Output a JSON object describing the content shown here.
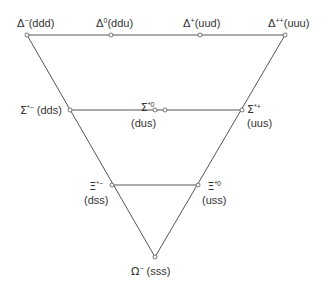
{
  "diagram": {
    "line_color": "#555555",
    "node_fill": "#ffffff",
    "rows": [
      {
        "name": "delta-row",
        "nodes": [
          {
            "symbol": "Δ",
            "charge": "−",
            "quarks": "(ddd)"
          },
          {
            "symbol": "Δ",
            "charge": "0",
            "quarks": "(ddu)"
          },
          {
            "symbol": "Δ",
            "charge": "+",
            "quarks": "(uud)"
          },
          {
            "symbol": "Δ",
            "charge": "++",
            "quarks": "(uuu)"
          }
        ]
      },
      {
        "name": "sigma-star-row",
        "nodes": [
          {
            "symbol": "Σ",
            "charge": "*−",
            "quarks": "(dds)"
          },
          {
            "symbol": "Σ",
            "charge": "*0",
            "quarks": "(dus)"
          },
          {
            "symbol": "Σ",
            "charge": "*+",
            "quarks": "(uus)"
          }
        ]
      },
      {
        "name": "xi-star-row",
        "nodes": [
          {
            "symbol": "Ξ",
            "charge": "*−",
            "quarks": "(dss)"
          },
          {
            "symbol": "Ξ",
            "charge": "*0",
            "quarks": "(uss)"
          }
        ]
      },
      {
        "name": "omega-row",
        "nodes": [
          {
            "symbol": "Ω",
            "charge": "−",
            "quarks": "(sss)"
          }
        ]
      }
    ]
  }
}
